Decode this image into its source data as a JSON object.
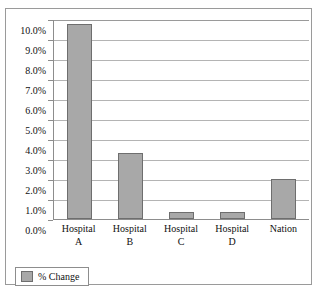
{
  "top_text_remnant": "",
  "legend": {
    "position": "bottom-left",
    "entries": [
      {
        "label": "% Change",
        "color": "#a8a8a8"
      }
    ]
  },
  "axis": {
    "y_ticks": [
      "0.0%",
      "1.0%",
      "2.0%",
      "3.0%",
      "4.0%",
      "5.0%",
      "6.0%",
      "7.0%",
      "8.0%",
      "9.0%",
      "10.0%"
    ]
  },
  "colors": {
    "bar_fill": "#a8a8a8",
    "bar_border": "#6e6e6e",
    "gridline": "#b4b4b4",
    "frame": "#9a9a9a",
    "plot_background": "#ffffff"
  },
  "categories_display": [
    {
      "line1": "Hospital",
      "line2": "A"
    },
    {
      "line1": "Hospital",
      "line2": "B"
    },
    {
      "line1": "Hospital",
      "line2": "C"
    },
    {
      "line1": "Hospital",
      "line2": "D"
    },
    {
      "line1": "Nation",
      "line2": ""
    }
  ],
  "chart_data": {
    "type": "bar",
    "title": "",
    "xlabel": "",
    "ylabel": "",
    "categories": [
      "Hospital A",
      "Hospital B",
      "Hospital C",
      "Hospital D",
      "Nation"
    ],
    "series": [
      {
        "name": "% Change",
        "values": [
          9.75,
          3.3,
          0.35,
          0.35,
          2.0
        ],
        "color": "#a8a8a8"
      }
    ],
    "ylim": [
      0.0,
      10.0
    ],
    "ytick_step": 1.0,
    "ytick_labels": [
      "0.0%",
      "1.0%",
      "2.0%",
      "3.0%",
      "4.0%",
      "5.0%",
      "6.0%",
      "7.0%",
      "8.0%",
      "9.0%",
      "10.0%"
    ],
    "value_format": "percent",
    "grid": {
      "horizontal": true,
      "vertical": false
    },
    "legend_position": "bottom-left"
  }
}
